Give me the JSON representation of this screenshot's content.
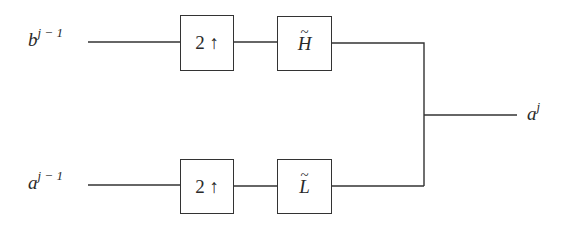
{
  "diagram": {
    "type": "signal-flow block diagram (wavelet synthesis / reconstruction)",
    "inputs": [
      {
        "id": "in-top",
        "base": "b",
        "superscript": "j − 1"
      },
      {
        "id": "in-bottom",
        "base": "a",
        "superscript": "j − 1"
      }
    ],
    "blocks": [
      {
        "id": "upsample-top",
        "label": "2 ↑"
      },
      {
        "id": "filter-h",
        "label": "H",
        "accent": "~"
      },
      {
        "id": "upsample-bottom",
        "label": "2 ↑"
      },
      {
        "id": "filter-l",
        "label": "L",
        "accent": "~"
      }
    ],
    "output": {
      "base": "a",
      "superscript": "j"
    },
    "edges": [
      [
        "in-top",
        "upsample-top"
      ],
      [
        "upsample-top",
        "filter-h"
      ],
      [
        "filter-h",
        "sum-junction"
      ],
      [
        "in-bottom",
        "upsample-bottom"
      ],
      [
        "upsample-bottom",
        "filter-l"
      ],
      [
        "filter-l",
        "sum-junction"
      ],
      [
        "sum-junction",
        "output"
      ]
    ],
    "colors": {
      "line": "#333333",
      "text": "#2a2a2a",
      "background": "#ffffff"
    }
  }
}
